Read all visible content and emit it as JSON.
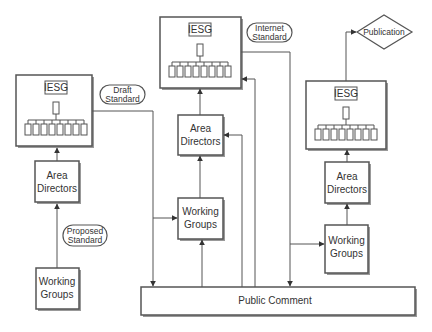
{
  "diagram": {
    "type": "flowchart",
    "colors": {
      "stroke": "#555555",
      "fill": "#ffffff",
      "text": "#333333",
      "shadow": "#999999"
    },
    "nodes": {
      "esg_left": {
        "label": "IESG"
      },
      "esg_mid": {
        "label": "IESG"
      },
      "esg_right": {
        "label": "IESG"
      },
      "ad_left": {
        "line1": "Area",
        "line2": "Directors"
      },
      "ad_mid": {
        "line1": "Area",
        "line2": "Directors"
      },
      "ad_right": {
        "line1": "Area",
        "line2": "Directors"
      },
      "wg_left": {
        "line1": "Working",
        "line2": "Groups"
      },
      "wg_mid": {
        "line1": "Working",
        "line2": "Groups"
      },
      "wg_right": {
        "line1": "Working",
        "line2": "Groups"
      },
      "public_comment": {
        "label": "Public Comment"
      },
      "publication": {
        "label": "Publication"
      }
    },
    "stage_labels": {
      "proposed": {
        "line1": "Proposed",
        "line2": "Standard"
      },
      "draft": {
        "line1": "Draft",
        "line2": "Standard"
      },
      "internet": {
        "line1": "Internet",
        "line2": "Standard"
      }
    },
    "edges": [
      {
        "from": "Working Groups (left)",
        "to": "Area Directors (left)",
        "label": "Proposed Standard"
      },
      {
        "from": "Area Directors (left)",
        "to": "IESG (left)"
      },
      {
        "from": "IESG (left)",
        "to": "Public Comment",
        "label": "Draft Standard"
      },
      {
        "from": "IESG (left)",
        "to": "Working Groups (middle)"
      },
      {
        "from": "Public Comment",
        "to": "Working Groups (middle)"
      },
      {
        "from": "Working Groups (middle)",
        "to": "Area Directors (middle)"
      },
      {
        "from": "Public Comment",
        "to": "Area Directors (middle)"
      },
      {
        "from": "Area Directors (middle)",
        "to": "IESG (middle)"
      },
      {
        "from": "Public Comment",
        "to": "IESG (middle)"
      },
      {
        "from": "IESG (middle)",
        "to": "Public Comment",
        "label": "Internet Standard"
      },
      {
        "from": "IESG (middle)",
        "to": "Working Groups (right)"
      },
      {
        "from": "Working Groups (right)",
        "to": "Area Directors (right)"
      },
      {
        "from": "Area Directors (right)",
        "to": "IESG (right)"
      },
      {
        "from": "IESG (right)",
        "to": "Publication"
      }
    ]
  }
}
